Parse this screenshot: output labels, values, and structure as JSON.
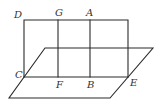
{
  "diagram": {
    "type": "geometry-figure",
    "stroke_color": "#2a2a2a",
    "label_color": "#333333",
    "points": {
      "D": {
        "label": "D",
        "x": 24,
        "y": 20
      },
      "G": {
        "label": "G",
        "x": 58,
        "y": 20
      },
      "A": {
        "label": "A",
        "x": 90,
        "y": 20
      },
      "C": {
        "label": "C",
        "x": 24,
        "y": 77
      },
      "F": {
        "label": "F",
        "x": 58,
        "y": 77
      },
      "B": {
        "label": "B",
        "x": 90,
        "y": 77
      },
      "E": {
        "label": "E",
        "x": 128,
        "y": 77
      }
    },
    "labels": [
      {
        "text": "D",
        "x": 14,
        "y": 10
      },
      {
        "text": "G",
        "x": 55,
        "y": 8
      },
      {
        "text": "A",
        "x": 86,
        "y": 8
      },
      {
        "text": "C",
        "x": 15,
        "y": 70
      },
      {
        "text": "F",
        "x": 56,
        "y": 80
      },
      {
        "text": "B",
        "x": 87,
        "y": 80
      },
      {
        "text": "E",
        "x": 130,
        "y": 78
      }
    ],
    "vertical_plane": {
      "top_left": [
        24,
        20
      ],
      "top_right": [
        128,
        20
      ],
      "bottom_right": [
        128,
        77
      ],
      "bottom_left": [
        24,
        77
      ]
    },
    "horizontal_plane": {
      "back_left": [
        45,
        48
      ],
      "back_right": [
        153,
        48
      ],
      "front_right": [
        110,
        98
      ],
      "front_left": [
        9,
        98
      ]
    },
    "segments": [
      {
        "name": "GF",
        "from": "G",
        "to": "F"
      },
      {
        "name": "AB",
        "from": "A",
        "to": "B"
      },
      {
        "name": "CE",
        "from": "C",
        "to": "E"
      }
    ]
  }
}
